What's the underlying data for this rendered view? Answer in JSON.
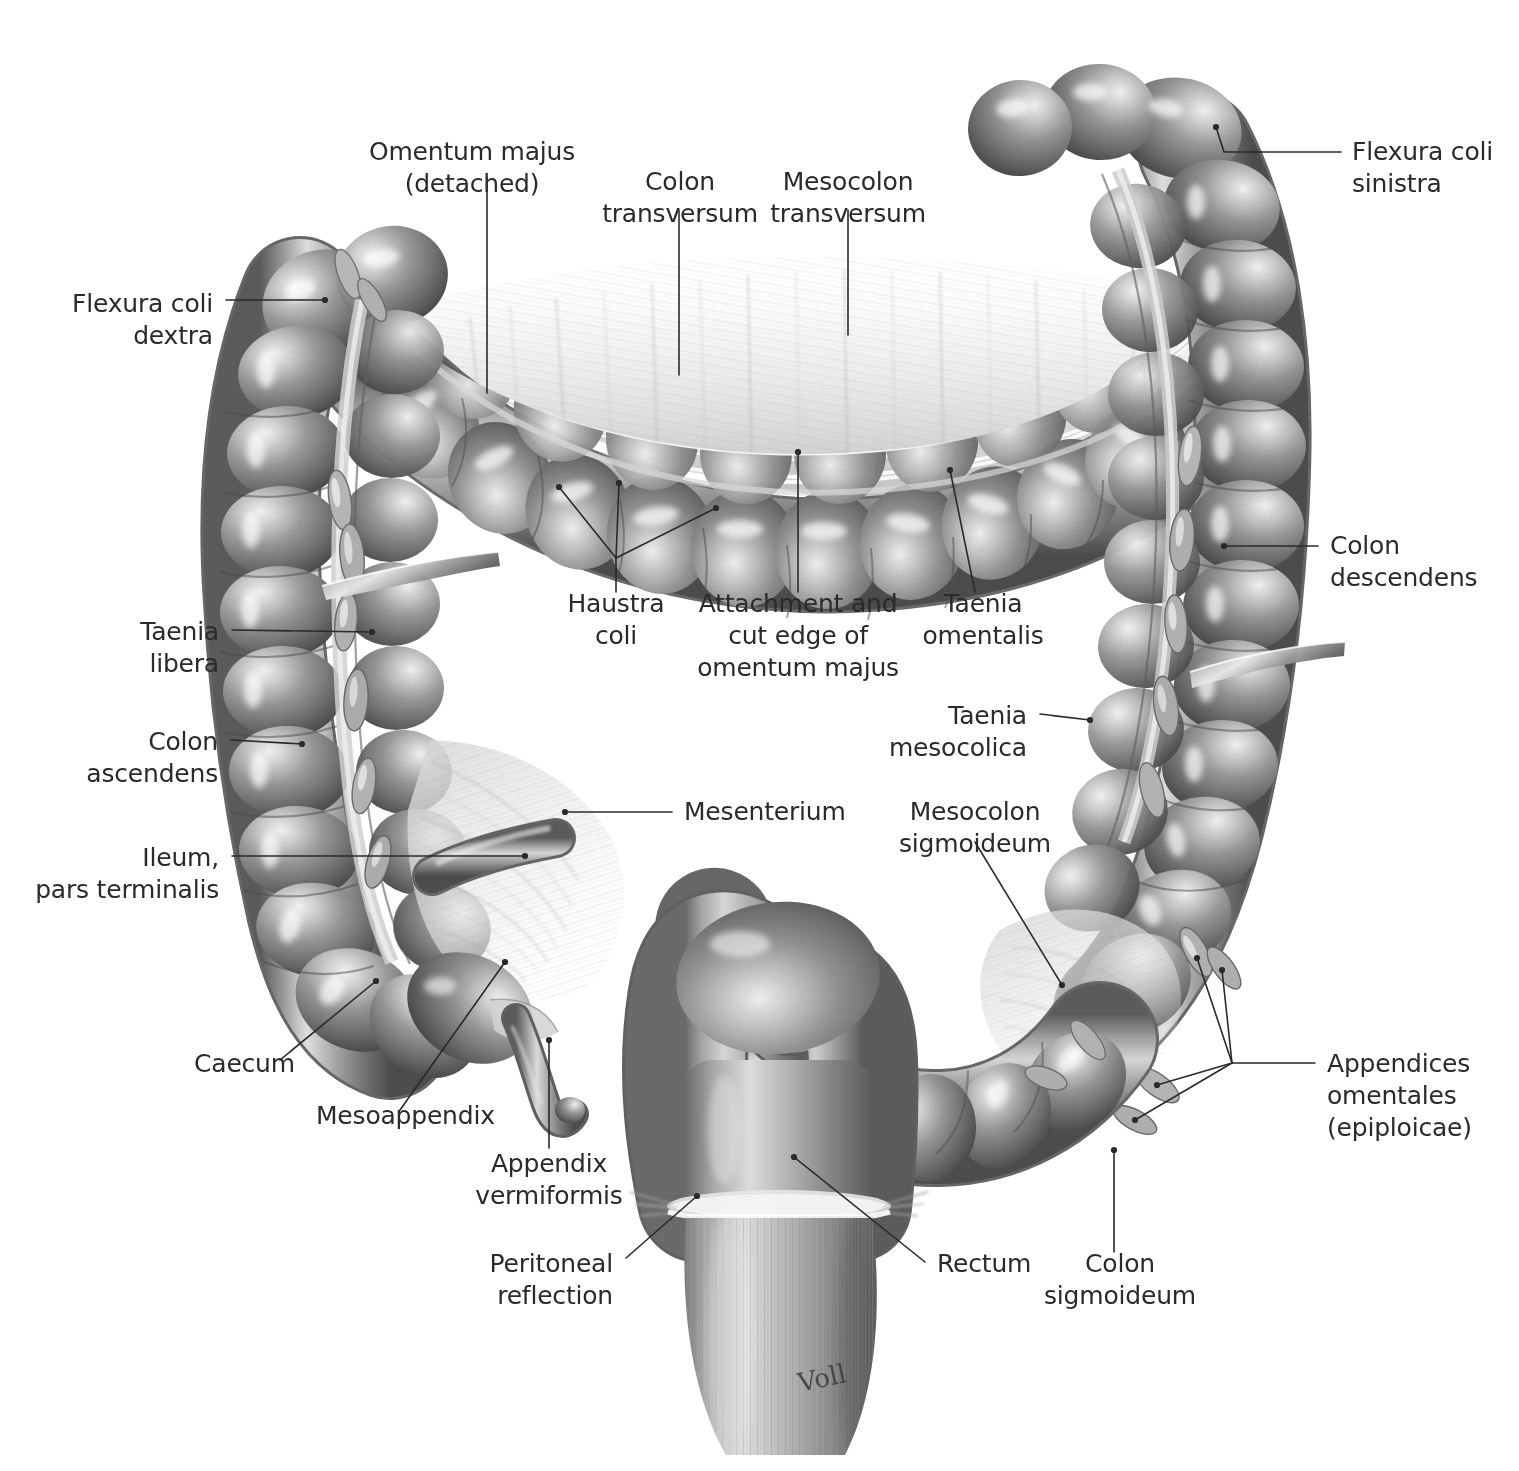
{
  "figure": {
    "background_color": "#ffffff",
    "label_color": "#2b2a2a",
    "leader_color": "#2b2a2a",
    "artist_signature": "Voll",
    "organ_tones": {
      "mid_gray": "#8d8d8d",
      "shadow_gray": "#4f4f4f",
      "deep_shadow": "#3a3a3a",
      "highlight": "#f2f2f2",
      "membrane_pale": "#e3e3e3",
      "membrane_white": "#f7f7f7"
    }
  },
  "labels": [
    {
      "id": "omentum-majus-detached",
      "lines": [
        "Omentum majus",
        "(detached)"
      ],
      "anchor": "middle",
      "x": 472,
      "y": 160
    },
    {
      "id": "colon-transversum",
      "lines": [
        "Colon",
        "transversum"
      ],
      "anchor": "middle",
      "x": 680,
      "y": 190
    },
    {
      "id": "mesocolon-transversum",
      "lines": [
        "Mesocolon",
        "transversum"
      ],
      "anchor": "middle",
      "x": 848,
      "y": 190
    },
    {
      "id": "flexura-coli-sinistra",
      "lines": [
        "Flexura coli",
        "sinistra"
      ],
      "anchor": "start",
      "x": 1352,
      "y": 160
    },
    {
      "id": "flexura-coli-dextra",
      "lines": [
        "Flexura coli",
        "dextra"
      ],
      "anchor": "end",
      "x": 213,
      "y": 312
    },
    {
      "id": "colon-descendens",
      "lines": [
        "Colon",
        "descendens"
      ],
      "anchor": "start",
      "x": 1330,
      "y": 554
    },
    {
      "id": "haustra-coli",
      "lines": [
        "Haustra",
        "coli"
      ],
      "anchor": "middle",
      "x": 616,
      "y": 612
    },
    {
      "id": "attachment-cut-edge",
      "lines": [
        "Attachment and",
        "cut edge of",
        "omentum majus"
      ],
      "anchor": "middle",
      "x": 798,
      "y": 612
    },
    {
      "id": "taenia-omentalis",
      "lines": [
        "Taenia",
        "omentalis"
      ],
      "anchor": "middle",
      "x": 983,
      "y": 612
    },
    {
      "id": "taenia-libera",
      "lines": [
        "Taenia",
        "libera"
      ],
      "anchor": "end",
      "x": 219,
      "y": 640
    },
    {
      "id": "taenia-mesocolica",
      "lines": [
        "Taenia",
        "mesocolica"
      ],
      "anchor": "end",
      "x": 1027,
      "y": 724
    },
    {
      "id": "colon-ascendens",
      "lines": [
        "Colon",
        "ascendens"
      ],
      "anchor": "end",
      "x": 218,
      "y": 750
    },
    {
      "id": "mesenterium",
      "lines": [
        "Mesenterium"
      ],
      "anchor": "start",
      "x": 684,
      "y": 820
    },
    {
      "id": "mesocolon-sigmoideum",
      "lines": [
        "Mesocolon",
        "sigmoideum"
      ],
      "anchor": "middle",
      "x": 975,
      "y": 820
    },
    {
      "id": "ileum-pars-terminalis",
      "lines": [
        "Ileum,",
        "pars terminalis"
      ],
      "anchor": "end",
      "x": 219,
      "y": 866
    },
    {
      "id": "caecum",
      "lines": [
        "Caecum"
      ],
      "anchor": "start",
      "x": 194,
      "y": 1072
    },
    {
      "id": "appendices-omentales",
      "lines": [
        "Appendices",
        "omentales",
        "(epiploicae)"
      ],
      "anchor": "start",
      "x": 1327,
      "y": 1072
    },
    {
      "id": "mesoappendix",
      "lines": [
        "Mesoappendix"
      ],
      "anchor": "start",
      "x": 316,
      "y": 1124
    },
    {
      "id": "appendix-vermiformis",
      "lines": [
        "Appendix",
        "vermiformis"
      ],
      "anchor": "middle",
      "x": 549,
      "y": 1172
    },
    {
      "id": "rectum",
      "lines": [
        "Rectum"
      ],
      "anchor": "start",
      "x": 937,
      "y": 1272
    },
    {
      "id": "colon-sigmoideum",
      "lines": [
        "Colon",
        "sigmoideum"
      ],
      "anchor": "middle",
      "x": 1120,
      "y": 1272
    },
    {
      "id": "peritoneal-reflection",
      "lines": [
        "Peritoneal",
        "reflection"
      ],
      "anchor": "end",
      "x": 613,
      "y": 1272
    }
  ],
  "leaders": [
    {
      "id": "leader-omentum-majus-detached",
      "path": "M 487,178 L 487,393"
    },
    {
      "id": "leader-colon-transversum",
      "path": "M 679,210 L 679,375"
    },
    {
      "id": "leader-mesocolon-transversum",
      "path": "M 848,210 L 848,335"
    },
    {
      "id": "leader-flexura-coli-sinistra",
      "path": "M 1341,152 L 1224,152 L 1216,127",
      "endpoint": [
        1216,
        127
      ]
    },
    {
      "id": "leader-flexura-coli-dextra",
      "path": "M 226,300 L 325,300",
      "endpoint": [
        325,
        300
      ]
    },
    {
      "id": "leader-colon-descendens",
      "path": "M 1318,546 L 1224,546",
      "endpoint": [
        1224,
        546
      ]
    },
    {
      "id": "leader-haustra-coli-stem",
      "path": "M 616,592 L 616,558"
    },
    {
      "id": "leader-haustra-coli-b1",
      "path": "M 616,558 L 559,487",
      "endpoint": [
        559,
        487
      ]
    },
    {
      "id": "leader-haustra-coli-b2",
      "path": "M 616,558 L 619,483",
      "endpoint": [
        619,
        483
      ]
    },
    {
      "id": "leader-haustra-coli-b3",
      "path": "M 616,558 L 716,508",
      "endpoint": [
        716,
        508
      ]
    },
    {
      "id": "leader-attachment-cut-edge",
      "path": "M 798,592 L 798,452",
      "endpoint": [
        798,
        452
      ]
    },
    {
      "id": "leader-taenia-omentalis",
      "path": "M 975,592 L 950,470",
      "endpoint": [
        950,
        470
      ]
    },
    {
      "id": "leader-taenia-libera",
      "path": "M 232,630 L 372,632",
      "endpoint": [
        372,
        632
      ]
    },
    {
      "id": "leader-taenia-mesocolica",
      "path": "M 1040,714 L 1090,720",
      "endpoint": [
        1090,
        720
      ]
    },
    {
      "id": "leader-colon-ascendens",
      "path": "M 231,740 L 302,744",
      "endpoint": [
        302,
        744
      ]
    },
    {
      "id": "leader-mesenterium",
      "path": "M 672,812 L 565,812",
      "endpoint": [
        565,
        812
      ]
    },
    {
      "id": "leader-mesocolon-sigmoideum",
      "path": "M 975,842 L 1062,985",
      "endpoint": [
        1062,
        985
      ]
    },
    {
      "id": "leader-ileum-pars-terminalis",
      "path": "M 232,856 L 525,856",
      "endpoint": [
        525,
        856
      ]
    },
    {
      "id": "leader-caecum",
      "path": "M 280,1060 L 376,981",
      "endpoint": [
        376,
        981
      ]
    },
    {
      "id": "leader-mesoappendix",
      "path": "M 400,1110 L 505,962",
      "endpoint": [
        505,
        962
      ]
    },
    {
      "id": "leader-appendix-vermiformis",
      "path": "M 549,1148 L 549,1040",
      "endpoint": [
        549,
        1040
      ]
    },
    {
      "id": "leader-appendices-hub",
      "path": "M 1315,1063 L 1232,1063"
    },
    {
      "id": "leader-appendices-b1",
      "path": "M 1232,1063 L 1197,958",
      "endpoint": [
        1197,
        958
      ]
    },
    {
      "id": "leader-appendices-b2",
      "path": "M 1232,1063 L 1222,970",
      "endpoint": [
        1222,
        970
      ]
    },
    {
      "id": "leader-appendices-b3",
      "path": "M 1232,1063 L 1157,1085",
      "endpoint": [
        1157,
        1085
      ]
    },
    {
      "id": "leader-appendices-b4",
      "path": "M 1232,1063 L 1135,1120",
      "endpoint": [
        1135,
        1120
      ]
    },
    {
      "id": "leader-rectum",
      "path": "M 925,1262 L 794,1157",
      "endpoint": [
        794,
        1157
      ]
    },
    {
      "id": "leader-colon-sigmoideum",
      "path": "M 1114,1252 L 1114,1150",
      "endpoint": [
        1114,
        1150
      ]
    },
    {
      "id": "leader-peritoneal-reflection",
      "path": "M 626,1258 L 697,1196",
      "endpoint": [
        697,
        1196
      ]
    }
  ]
}
